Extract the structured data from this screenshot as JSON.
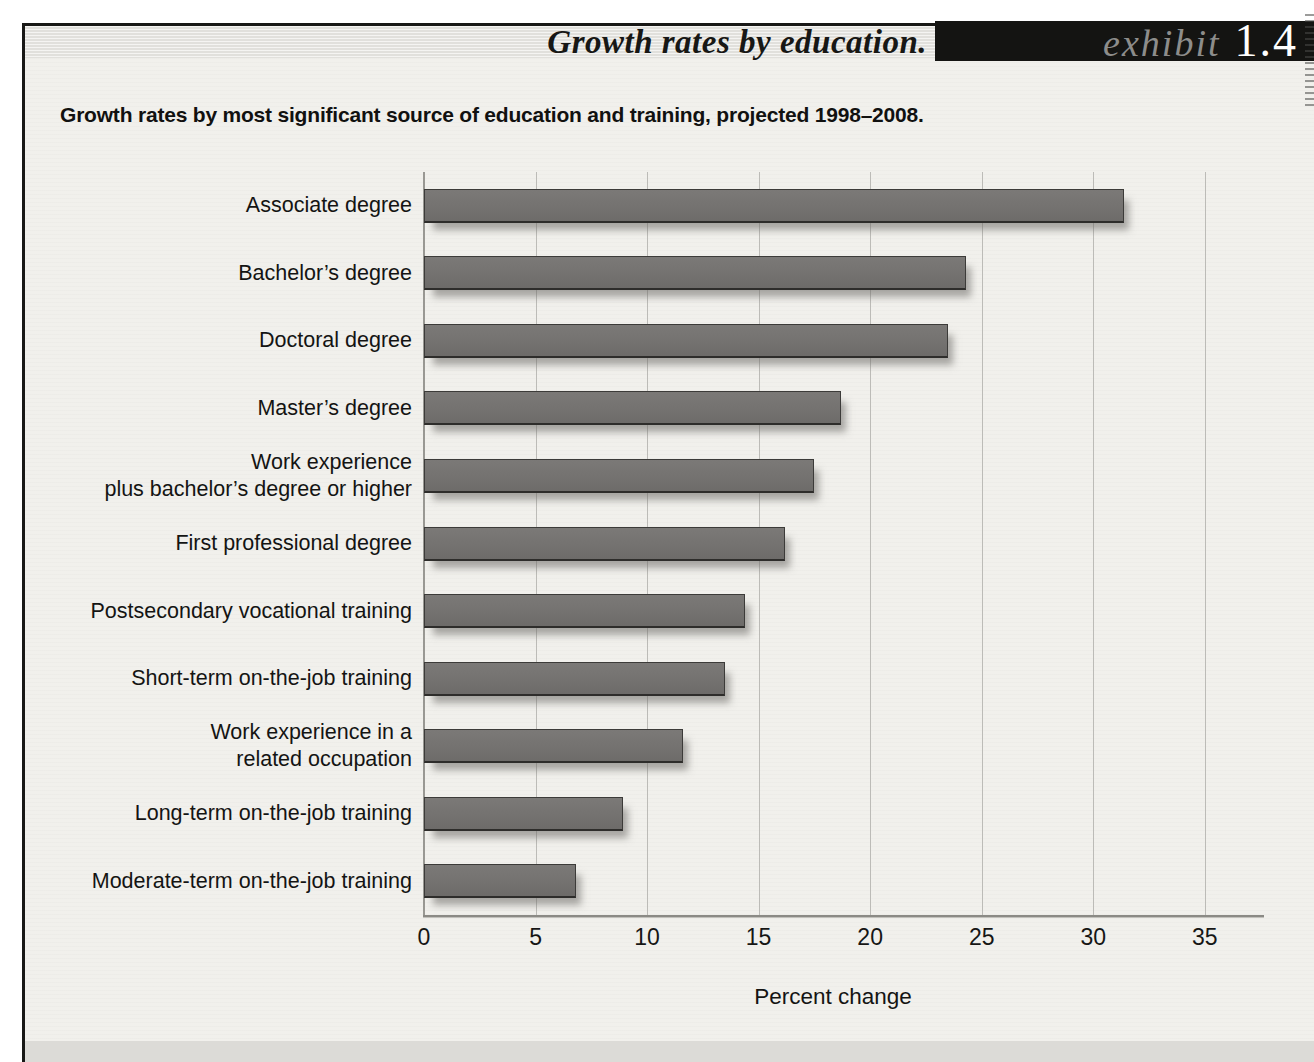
{
  "header": {
    "title": "Growth rates by education.",
    "exhibit_label": "exhibit",
    "exhibit_number": "1.4"
  },
  "subtitle": "Growth rates by most significant source of education and training, projected 1998–2008.",
  "chart_data": {
    "type": "bar",
    "orientation": "horizontal",
    "title": "Growth rates by most significant source of education and training, projected 1998–2008.",
    "categories": [
      "Associate degree",
      "Bachelor’s degree",
      "Doctoral degree",
      "Master’s degree",
      "Work experience\nplus bachelor’s degree or higher",
      "First professional degree",
      "Postsecondary vocational training",
      "Short-term on-the-job training",
      "Work experience in a\nrelated occupation",
      "Long-term on-the-job training",
      "Moderate-term on-the-job training"
    ],
    "values": [
      31.4,
      24.3,
      23.5,
      18.7,
      17.5,
      16.2,
      14.4,
      13.5,
      11.6,
      8.9,
      6.8
    ],
    "units": "percent",
    "xlabel": "Percent change",
    "xlim": [
      0,
      35
    ],
    "xticks": [
      0,
      5,
      10,
      15,
      20,
      25,
      30,
      35
    ],
    "grid": true,
    "legend": "none",
    "bar_color": "#747270",
    "gridline_color": "#bcbbb7",
    "background_color": "#f1f0ec"
  }
}
